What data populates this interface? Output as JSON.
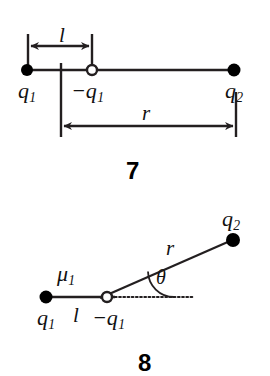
{
  "figure": {
    "background_color": "#ffffff",
    "line_color": "#231f20",
    "dot_fill_color": "#000000",
    "open_circle_fill": "#ffffff"
  },
  "diagram_7": {
    "number": "7",
    "labels": {
      "charge_left": "q",
      "charge_left_sub": "1",
      "charge_middle": "−q",
      "charge_middle_sub": "1",
      "charge_right": "q",
      "charge_right_sub": "2",
      "dipole_length": "l",
      "separation": "r"
    },
    "points": {
      "q1": {
        "x": 27,
        "y": 70,
        "type": "filled-circle",
        "radius": 6
      },
      "minus_q1": {
        "x": 92,
        "y": 70,
        "type": "open-circle",
        "radius": 5
      },
      "q2": {
        "x": 234,
        "y": 70,
        "type": "filled-circle",
        "radius": 6
      }
    },
    "dimension_l": {
      "x_start": 28,
      "x_end": 92,
      "y": 46
    },
    "dimension_r": {
      "x_start": 61,
      "x_end": 236,
      "y": 126
    }
  },
  "diagram_8": {
    "number": "8",
    "labels": {
      "charge_left": "q",
      "charge_left_sub": "1",
      "charge_middle": "−q",
      "charge_middle_sub": "1",
      "charge_right": "q",
      "charge_right_sub": "2",
      "dipole_length": "l",
      "separation": "r",
      "angle": "θ",
      "dipole_moment": "μ",
      "dipole_moment_sub": "1"
    },
    "points": {
      "q1": {
        "x": 46,
        "y": 297,
        "type": "filled-circle",
        "radius": 6
      },
      "minus_q1": {
        "x": 107,
        "y": 297,
        "type": "open-circle",
        "radius": 5
      },
      "q2": {
        "x": 233,
        "y": 240,
        "type": "filled-circle",
        "radius": 7
      }
    },
    "axis_line": {
      "x_start": 46,
      "x_end": 114,
      "y": 297
    },
    "dotted_line": {
      "x_start": 114,
      "x_end": 193,
      "y": 297
    },
    "slant_line": {
      "x_start": 100,
      "y_start": 298,
      "x_end": 229,
      "y_end": 241
    },
    "angle_arc": {
      "vertex_x": 148,
      "vertex_y": 297,
      "radius": 26,
      "angle_degrees": 24
    }
  }
}
